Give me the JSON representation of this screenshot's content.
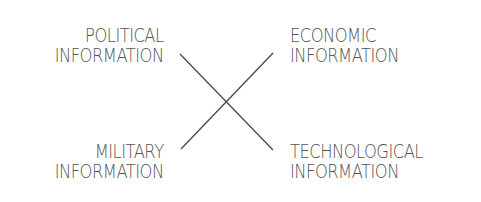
{
  "diagram": {
    "type": "cross-quadrant",
    "line_color": "#4a4a4a",
    "text_color": "#555555",
    "labels": {
      "top_left": {
        "line1": "POLITICAL",
        "line2": "INFORMATION"
      },
      "top_right": {
        "line1": "ECONOMIC",
        "line2": "INFORMATION"
      },
      "bottom_left": {
        "line1": "MILITARY",
        "line2": "INFORMATION"
      },
      "bottom_right": {
        "line1": "TECHNOLOGICAL",
        "line2": "INFORMATION"
      }
    },
    "connectors": [
      {
        "from": "top_left",
        "to": "bottom_right"
      },
      {
        "from": "top_right",
        "to": "bottom_left"
      }
    ]
  }
}
